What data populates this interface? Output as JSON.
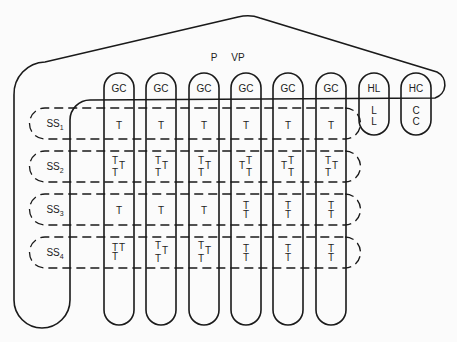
{
  "diagram": {
    "top_labels": {
      "p": "P",
      "vp": "VP"
    },
    "columns": [
      {
        "id": "gc1",
        "label": "GC",
        "x": 118
      },
      {
        "id": "gc2",
        "label": "GC",
        "x": 161
      },
      {
        "id": "gc3",
        "label": "GC",
        "x": 203
      },
      {
        "id": "gc4",
        "label": "GC",
        "x": 246
      },
      {
        "id": "gc5",
        "label": "GC",
        "x": 288
      },
      {
        "id": "gc6",
        "label": "GC",
        "x": 330
      }
    ],
    "short_columns": [
      {
        "id": "hl",
        "label": "HL",
        "contents": [
          "L",
          "L"
        ]
      },
      {
        "id": "hc",
        "label": "HC",
        "contents": [
          "C",
          "C"
        ]
      }
    ],
    "rows": [
      {
        "id": "ss1",
        "label": "SS",
        "sub": "1",
        "cells": [
          "T",
          "T",
          "T",
          "T",
          "T",
          "T"
        ]
      },
      {
        "id": "ss2",
        "label": "SS",
        "sub": "2",
        "cells": [
          "T T T",
          "T T T",
          "T T T",
          "T T T",
          "T T T",
          "T T T"
        ]
      },
      {
        "id": "ss3",
        "label": "SS",
        "sub": "3",
        "cells": [
          "T",
          "T",
          "T",
          "T T",
          "T T",
          "T T"
        ]
      },
      {
        "id": "ss4",
        "label": "SS",
        "sub": "4",
        "cells": [
          "TT T",
          "T T T",
          "T T T",
          "T T",
          "T T",
          "T T"
        ]
      }
    ]
  },
  "labels": {
    "p": "P",
    "vp": "VP",
    "gc": "GC",
    "hl": "HL",
    "hc": "HC",
    "ss": "SS",
    "s1": "1",
    "s2": "2",
    "s3": "3",
    "s4": "4",
    "t": "T",
    "l": "L",
    "c": "C"
  }
}
